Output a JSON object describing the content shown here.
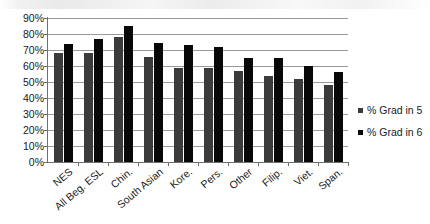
{
  "chart_data": {
    "type": "bar",
    "title": "",
    "xlabel": "",
    "ylabel": "",
    "ylim": [
      0,
      90
    ],
    "ytick_labels": [
      "90%",
      "80%",
      "70%",
      "60%",
      "50%",
      "40%",
      "30%",
      "20%",
      "10%",
      "0%"
    ],
    "ytick_values": [
      90,
      80,
      70,
      60,
      50,
      40,
      30,
      20,
      10,
      0
    ],
    "grid": true,
    "legend_position": "right",
    "categories": [
      "NES",
      "All Beg. ESL",
      "Chin.",
      "South Asian",
      "Kore.",
      "Pers.",
      "Other",
      "Filip.",
      "Viet.",
      "Span."
    ],
    "series": [
      {
        "name": "% Grad in 5",
        "color": "#3b3b3b",
        "values": [
          68,
          68,
          78,
          65.5,
          59,
          59,
          57,
          54,
          52,
          48
        ]
      },
      {
        "name": "% Grad in 6",
        "color": "#080808",
        "values": [
          74,
          77,
          85,
          74.5,
          73,
          72,
          65,
          65,
          60,
          56
        ]
      }
    ]
  },
  "legend": {
    "items": [
      {
        "label": "% Grad in 5"
      },
      {
        "label": "% Grad in 6"
      }
    ]
  }
}
